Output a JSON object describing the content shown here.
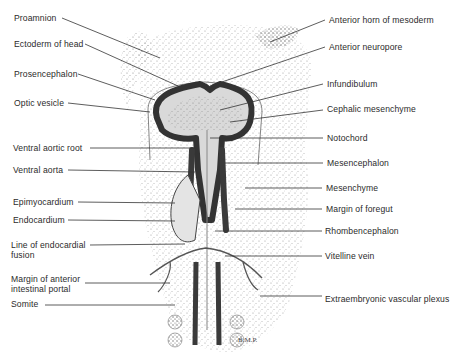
{
  "figure": {
    "signature": "B.M.P.",
    "left_labels": [
      {
        "text": "Proamnion",
        "x": 14,
        "y": 13,
        "line": [
          62,
          18,
          160,
          58
        ]
      },
      {
        "text": "Ectoderm of head",
        "x": 14,
        "y": 39,
        "line": [
          85,
          44,
          178,
          86
        ]
      },
      {
        "text": "Prosencephalon",
        "x": 14,
        "y": 69,
        "line": [
          78,
          74,
          155,
          100
        ]
      },
      {
        "text": "Optic vesicle",
        "x": 14,
        "y": 98,
        "line": [
          68,
          103,
          150,
          112
        ]
      },
      {
        "text": "Ventral aortic root",
        "x": 13,
        "y": 143,
        "line": [
          90,
          148,
          195,
          148
        ]
      },
      {
        "text": "Ventral aorta",
        "x": 13,
        "y": 165,
        "line": [
          68,
          170,
          195,
          172
        ]
      },
      {
        "text": "Epimyocardium",
        "x": 13,
        "y": 197,
        "line": [
          78,
          202,
          175,
          203
        ]
      },
      {
        "text": "Endocardium",
        "x": 13,
        "y": 215,
        "line": [
          68,
          220,
          175,
          221
        ]
      },
      {
        "text": "Line of endocardial fusion",
        "x": 11,
        "y": 240,
        "two": true,
        "line": [
          90,
          245,
          185,
          244
        ]
      },
      {
        "text": "Margin of anterior intestinal portal",
        "x": 11,
        "y": 274,
        "two": true,
        "line": [
          85,
          283,
          170,
          283
        ]
      },
      {
        "text": "Somite",
        "x": 11,
        "y": 299,
        "line": [
          45,
          305,
          175,
          305
        ]
      }
    ],
    "right_labels": [
      {
        "text": "Anterior horn of mesoderm",
        "x": 329,
        "y": 15,
        "line": [
          270,
          42,
          325,
          20
        ]
      },
      {
        "text": "Anterior neuropore",
        "x": 329,
        "y": 42,
        "line": [
          210,
          86,
          325,
          47
        ]
      },
      {
        "text": "Infundibulum",
        "x": 327,
        "y": 79,
        "line": [
          220,
          110,
          323,
          84
        ]
      },
      {
        "text": "Cephalic mesenchyme",
        "x": 327,
        "y": 104,
        "line": [
          230,
          122,
          323,
          110
        ]
      },
      {
        "text": "Notochord",
        "x": 327,
        "y": 133,
        "line": [
          210,
          138,
          323,
          138
        ]
      },
      {
        "text": "Mesencephalon",
        "x": 327,
        "y": 158,
        "line": [
          225,
          163,
          323,
          163
        ]
      },
      {
        "text": "Mesenchyme",
        "x": 326,
        "y": 183,
        "line": [
          245,
          188,
          322,
          188
        ]
      },
      {
        "text": "Margin of foregut",
        "x": 326,
        "y": 204,
        "line": [
          235,
          209,
          322,
          209
        ]
      },
      {
        "text": "Rhombencephalon",
        "x": 325,
        "y": 226,
        "line": [
          215,
          231,
          322,
          231
        ]
      },
      {
        "text": "Vitelline vein",
        "x": 325,
        "y": 251,
        "line": [
          225,
          256,
          322,
          256
        ]
      },
      {
        "text": "Extraembryonic vascular plexus",
        "x": 325,
        "y": 294,
        "line": [
          260,
          296,
          322,
          296
        ]
      }
    ]
  }
}
